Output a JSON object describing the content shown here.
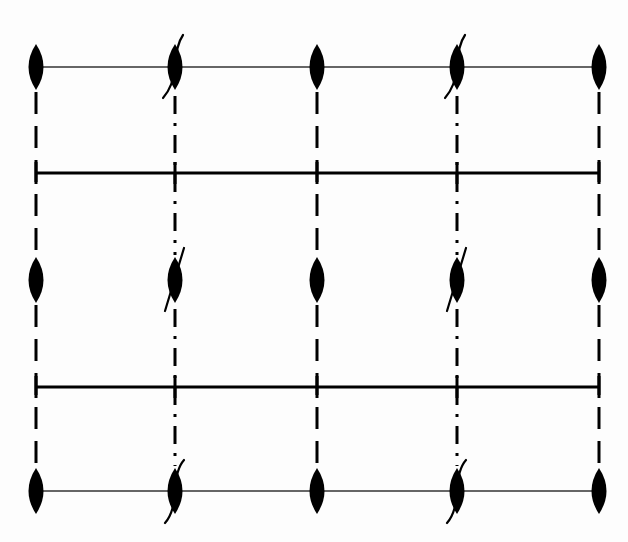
{
  "diagram": {
    "title": "",
    "colors": {
      "background": "#fdfdfd",
      "ink": "#000000",
      "thin_line": "#333333"
    },
    "columns": [
      {
        "x": 36,
        "line_style": "dashed",
        "tilted": false
      },
      {
        "x": 175,
        "line_style": "dash-dot",
        "tilted": true
      },
      {
        "x": 317,
        "line_style": "dashed",
        "tilted": false
      },
      {
        "x": 457,
        "line_style": "dash-dot",
        "tilted": true
      },
      {
        "x": 599,
        "line_style": "dashed",
        "tilted": false
      }
    ],
    "rows": [
      {
        "y": 67,
        "thin_line": true,
        "slash": "curve-up"
      },
      {
        "y": 280,
        "thin_line": false,
        "slash": "straight"
      },
      {
        "y": 491,
        "thin_line": true,
        "slash": "curve-down"
      }
    ],
    "thick_lines": [
      {
        "y": 173,
        "x1": 36,
        "x2": 599
      },
      {
        "y": 387,
        "x1": 36,
        "x2": 599
      }
    ],
    "lens": {
      "width": 15,
      "height": 46
    },
    "vertical_extent": {
      "y1": 90,
      "y2": 468
    },
    "labels": []
  }
}
